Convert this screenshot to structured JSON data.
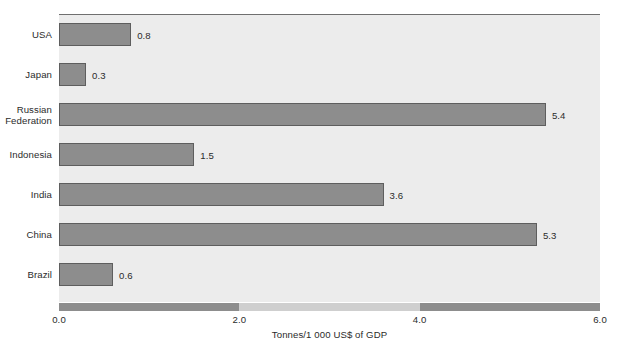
{
  "chart_data": {
    "type": "bar",
    "orientation": "horizontal",
    "title": "",
    "subtitle": "",
    "xlabel": "Tonnes/1 000 US$ of GDP",
    "ylabel": "",
    "xlim": [
      0.0,
      6.0
    ],
    "xticks": [
      "0.0",
      "2.0",
      "4.0",
      "6.0"
    ],
    "xtick_values": [
      0.0,
      2.0,
      4.0,
      6.0
    ],
    "grid": false,
    "legend": null,
    "categories": [
      "USA",
      "Japan",
      "Russian\nFederation",
      "Indonesia",
      "India",
      "China",
      "Brazil"
    ],
    "values": [
      0.8,
      0.3,
      5.4,
      1.5,
      3.6,
      5.3,
      0.6
    ],
    "value_labels": [
      "0.8",
      "0.3",
      "5.4",
      "1.5",
      "3.6",
      "5.3",
      "0.6"
    ],
    "series": [
      {
        "name": "CO2 intensity",
        "values": [
          0.8,
          0.3,
          5.4,
          1.5,
          3.6,
          5.3,
          0.6
        ]
      }
    ],
    "colors": {
      "bar_fill": "#8d8d8d",
      "bar_stroke": "#5e5e5e",
      "plot_background": "#ececec",
      "axis_bar_dark": "#8d8d8d",
      "axis_bar_light": "#cfcfcf",
      "text": "#2b2b2b",
      "page_background": "#ffffff"
    },
    "axis_bar_segments": [
      {
        "from": 0.0,
        "to": 2.0,
        "shade": "dark"
      },
      {
        "from": 2.0,
        "to": 4.0,
        "shade": "light"
      },
      {
        "from": 4.0,
        "to": 6.0,
        "shade": "dark"
      }
    ]
  }
}
